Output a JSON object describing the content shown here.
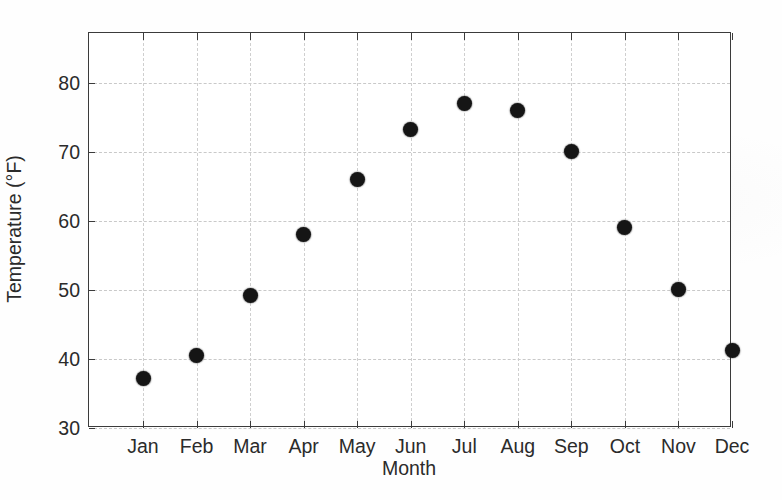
{
  "chart_data": {
    "type": "scatter",
    "title": "",
    "xlabel": "Month",
    "ylabel": "Temperature (°F)",
    "categories": [
      "Jan",
      "Feb",
      "Mar",
      "Apr",
      "May",
      "Jun",
      "Jul",
      "Aug",
      "Sep",
      "Oct",
      "Nov",
      "Dec"
    ],
    "values": [
      37.2,
      40.5,
      49.2,
      58.0,
      66.0,
      73.2,
      77.0,
      76.0,
      70.0,
      59.0,
      50.1,
      41.2
    ],
    "ylim": [
      30,
      87.2
    ],
    "yticks": [
      30,
      40,
      50,
      60,
      70,
      80
    ],
    "ytick_labels": [
      "30",
      "40",
      "50",
      "60",
      "70",
      "80"
    ],
    "grid": true,
    "legend": null,
    "marker": {
      "shape": "circle",
      "color": "#151515",
      "size_px": 15
    },
    "axes": {
      "frame_color": "#3b3b3b",
      "grid_color": "#c9c9c9",
      "grid_style": "dashed",
      "background": "#ffffff"
    }
  }
}
